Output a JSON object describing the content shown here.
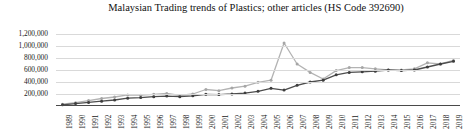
{
  "chart_data": {
    "type": "line",
    "title": "Malaysian Trading trends of Plastics; other articles (HS Code 392690)",
    "xlabel": "",
    "ylabel": "",
    "ylim": [
      0,
      1200000
    ],
    "ytick_labels": [
      "1,200,000",
      "1,000,000",
      "800,000",
      "600,000",
      "400,000",
      "200,000"
    ],
    "ytick_values": [
      1200000,
      1000000,
      800000,
      600000,
      400000,
      200000
    ],
    "grid": true,
    "legend": "none",
    "categories": [
      "1989",
      "1990",
      "1991",
      "1992",
      "1993",
      "1994",
      "1995",
      "1996",
      "1997",
      "1998",
      "1999",
      "2000",
      "2001",
      "2002",
      "2003",
      "2004",
      "2005",
      "2006",
      "2007",
      "2008",
      "2009",
      "2010",
      "2011",
      "2012",
      "2013",
      "2014",
      "2015",
      "2016",
      "2017",
      "2018",
      "2019"
    ],
    "series": [
      {
        "name": "Exports",
        "color": "#b3b3b3",
        "marker_color": "#a6a6a6",
        "values": [
          30000,
          55000,
          90000,
          125000,
          150000,
          185000,
          180000,
          195000,
          210000,
          175000,
          200000,
          275000,
          255000,
          300000,
          330000,
          395000,
          430000,
          1050000,
          700000,
          560000,
          450000,
          590000,
          640000,
          640000,
          620000,
          600000,
          600000,
          620000,
          720000,
          700000,
          760000
        ]
      },
      {
        "name": "Imports",
        "color": "#4d4d4d",
        "marker_color": "#3d3d3d",
        "values": [
          20000,
          40000,
          60000,
          80000,
          100000,
          130000,
          140000,
          155000,
          165000,
          155000,
          170000,
          195000,
          190000,
          200000,
          215000,
          245000,
          295000,
          265000,
          345000,
          400000,
          430000,
          520000,
          560000,
          570000,
          580000,
          600000,
          590000,
          600000,
          650000,
          700000,
          745000
        ]
      }
    ]
  }
}
